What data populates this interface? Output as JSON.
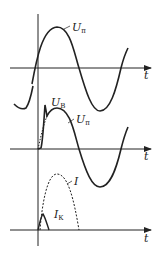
{
  "diagram": {
    "title": "",
    "panels": [
      {
        "id": "panel-1",
        "axis_label": "t",
        "curves": [
          {
            "label_main": "U",
            "label_sub": "п",
            "style": "solid",
            "description": "supply voltage sine wave"
          }
        ]
      },
      {
        "id": "panel-2",
        "axis_label": "t",
        "curves": [
          {
            "label_main": "U",
            "label_sub": "В",
            "style": "solid",
            "description": "voltage with spike at onset"
          },
          {
            "label_main": "U",
            "label_sub": "п",
            "style": "solid",
            "description": "supply voltage sine wave"
          }
        ]
      },
      {
        "id": "panel-3",
        "axis_label": "t",
        "curves": [
          {
            "label_main": "I",
            "label_sub": "",
            "style": "dotted",
            "description": "current half-wave"
          },
          {
            "label_main": "I",
            "label_sub": "К",
            "style": "solid",
            "description": "short current pulse"
          }
        ]
      }
    ],
    "colors": {
      "line": "#222222",
      "background": "#ffffff"
    }
  }
}
